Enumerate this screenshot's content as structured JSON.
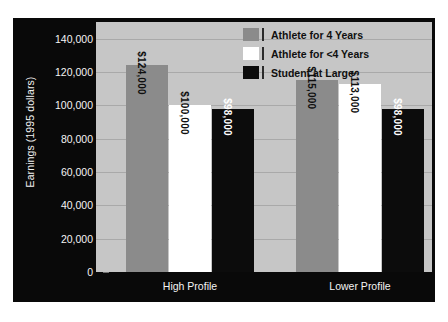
{
  "chart_data": {
    "type": "bar",
    "title": "",
    "xlabel": "",
    "ylabel": "Earnings (1995 dollars)",
    "ylim": [
      0,
      150000
    ],
    "grid": true,
    "legend_position": "top-center-inside",
    "categories": [
      "High Profile",
      "Lower Profile"
    ],
    "yticks": [
      "0",
      "20,000",
      "40,000",
      "60,000",
      "80,000",
      "100,000",
      "120,000",
      "140,000"
    ],
    "ytick_values": [
      0,
      20000,
      40000,
      60000,
      80000,
      100000,
      120000,
      140000
    ],
    "series": [
      {
        "name": "Athlete for 4 Years",
        "color": "#8b8b8b",
        "text_color": "dark",
        "values": [
          124000,
          115000
        ],
        "labels": [
          "$124,000",
          "$115,000"
        ]
      },
      {
        "name": "Athlete for <4 Years",
        "color": "#ffffff",
        "text_color": "dark",
        "values": [
          100000,
          113000
        ],
        "labels": [
          "$100,000",
          "$113,000"
        ]
      },
      {
        "name": "Student at Large",
        "color": "#0c0c0c",
        "text_color": "light",
        "values": [
          98000,
          98000
        ],
        "labels": [
          "$98,000",
          "$98,000"
        ]
      }
    ]
  },
  "colors": {
    "frame": "#090909",
    "plot_background": "#c6c6c6",
    "gridline": "#a9a9a9",
    "axis_text": "#f4f4f4",
    "legend_text": "#101010"
  }
}
